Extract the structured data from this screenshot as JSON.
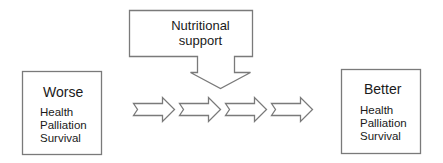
{
  "diagram": {
    "intervention": {
      "label_line1": "Nutritional",
      "label_line2": "support",
      "shape": "down-arrow-callout"
    },
    "from_state": {
      "title": "Worse",
      "items": [
        "Health",
        "Palliation",
        "Survival"
      ]
    },
    "to_state": {
      "title": "Better",
      "items": [
        "Health",
        "Palliation",
        "Survival"
      ]
    },
    "flow_arrows": {
      "count": 4,
      "direction": "right",
      "shape": "notched-right-arrow"
    },
    "colors": {
      "stroke": "#7a7a7a",
      "fill": "#ffffff",
      "text": "#1a1a1a"
    }
  }
}
